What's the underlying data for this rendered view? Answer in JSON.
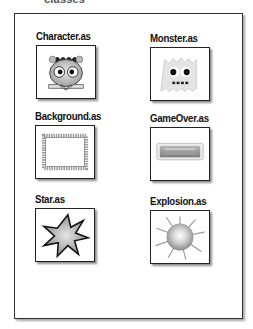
{
  "header": {
    "title_fragment": "classes"
  },
  "panel": {
    "items": [
      {
        "label": "Character.as",
        "icon": "character-icon"
      },
      {
        "label": "Monster.as",
        "icon": "monster-icon"
      },
      {
        "label": "Background.as",
        "icon": "background-icon"
      },
      {
        "label": "GameOver.as",
        "icon": "gameover-icon"
      },
      {
        "label": "Star.as",
        "icon": "star-icon"
      },
      {
        "label": "Explosion.as",
        "icon": "explosion-icon"
      }
    ]
  }
}
